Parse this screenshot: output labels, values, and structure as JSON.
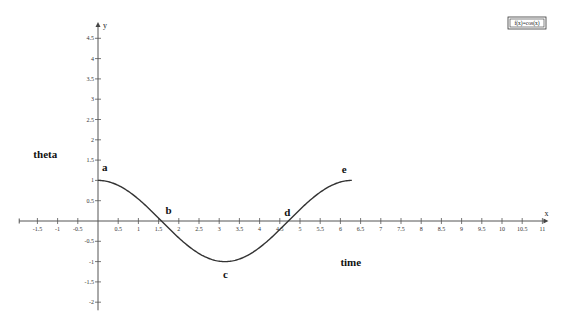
{
  "chart_data": {
    "type": "line",
    "title": "",
    "xlabel": "x",
    "ylabel": "y",
    "xlim": [
      -1.95,
      11.1
    ],
    "ylim": [
      -2.2,
      4.85
    ],
    "grid": false,
    "x_ticks": [
      -1.5,
      -1,
      -0.5,
      0.5,
      1,
      1.5,
      2,
      2.5,
      3,
      3.5,
      4,
      4.5,
      5,
      5.5,
      6,
      6.5,
      7,
      7.5,
      8,
      8.5,
      9,
      9.5,
      10,
      10.5,
      11
    ],
    "y_ticks": [
      -2,
      -1.5,
      -1,
      -0.5,
      0.5,
      1,
      1.5,
      2,
      2.5,
      3,
      3.5,
      4,
      4.5
    ],
    "series": [
      {
        "name": "f(x)=cos(x)",
        "function": "cos",
        "domain": [
          0,
          6.283
        ],
        "color": "#333333"
      }
    ],
    "legend": {
      "text": "f(x)=cos(x)",
      "position": "top-right"
    },
    "point_labels": [
      {
        "text": "a",
        "x": 0,
        "y": 1
      },
      {
        "text": "b",
        "x": 1.571,
        "y": 0
      },
      {
        "text": "c",
        "x": 3.142,
        "y": -1
      },
      {
        "text": "d",
        "x": 4.712,
        "y": 0
      },
      {
        "text": "e",
        "x": 6.283,
        "y": 1
      }
    ],
    "annotations": [
      {
        "text": "theta",
        "x": -1.6,
        "y": 1.55
      },
      {
        "text": "time",
        "x": 6,
        "y": -1.1
      }
    ]
  }
}
